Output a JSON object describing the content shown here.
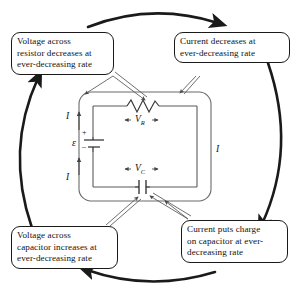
{
  "diagram": {
    "type": "rc-circuit-feedback-loop",
    "title_visible": false,
    "loop_direction": "clockwise",
    "callouts": {
      "top_left": {
        "name": "resistor-voltage-callout",
        "lines": [
          "Voltage across",
          "resistor decreases at",
          "ever-decreasing rate"
        ]
      },
      "top_right": {
        "name": "current-callout",
        "lines": [
          "Current decreases at",
          "ever-decreasing rate"
        ]
      },
      "bottom_left": {
        "name": "capacitor-voltage-callout",
        "lines": [
          "Voltage across",
          "capacitor increases at",
          "ever-decreasing rate"
        ]
      },
      "bottom_right": {
        "name": "capacitor-charge-callout",
        "lines": [
          "Current puts charge",
          "on capacitor at ever-",
          "decreasing rate"
        ]
      }
    },
    "circuit": {
      "current_labels": [
        "I",
        "I",
        "I"
      ],
      "resistor_voltage": {
        "symbol": "V",
        "subscript": "R"
      },
      "capacitor_voltage": {
        "symbol": "V",
        "subscript": "C"
      },
      "emf_symbol": "ε",
      "emf_plus": "+",
      "emf_minus": "–",
      "components": [
        "resistor",
        "capacitor",
        "battery"
      ]
    },
    "colors": {
      "ink": "#111111",
      "loop_arrow": "#1a1a1a",
      "circuit_line": "#5a5a5a",
      "background": "#ffffff"
    }
  }
}
